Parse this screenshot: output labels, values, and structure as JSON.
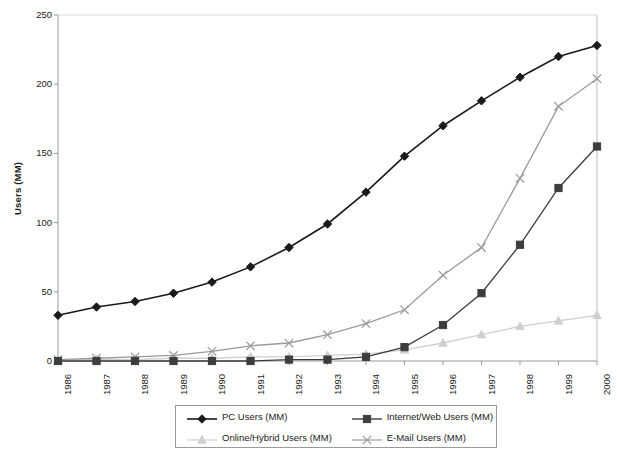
{
  "chart_data": {
    "type": "line",
    "title": "",
    "xlabel": "",
    "ylabel": "Users (MM)",
    "ylim": [
      0,
      250
    ],
    "yticks": [
      0,
      50,
      100,
      150,
      200,
      250
    ],
    "grid": false,
    "legend_position": "bottom",
    "categories": [
      "1986",
      "1987",
      "1988",
      "1989",
      "1990",
      "1991",
      "1992",
      "1993",
      "1994",
      "1995",
      "1996",
      "1997",
      "1998",
      "1999",
      "2000"
    ],
    "series": [
      {
        "name": "PC Users (MM)",
        "marker": "diamond",
        "color": "#1a1a1a",
        "values": [
          33,
          39,
          43,
          49,
          57,
          68,
          82,
          99,
          122,
          148,
          170,
          188,
          205,
          220,
          228
        ]
      },
      {
        "name": "Internet/Web Users (MM)",
        "marker": "square",
        "color": "#3d3d3d",
        "values": [
          0,
          0,
          0,
          0,
          0,
          0,
          1,
          1,
          3,
          10,
          26,
          49,
          84,
          125,
          155
        ]
      },
      {
        "name": "Online/Hybrid Users (MM)",
        "marker": "triangle",
        "color": "#cfcfcf",
        "values": [
          1,
          1,
          1,
          2,
          2,
          3,
          3,
          4,
          5,
          8,
          13,
          19,
          25,
          29,
          33
        ]
      },
      {
        "name": "E-Mail Users (MM)",
        "marker": "cross",
        "color": "#9a9a9a",
        "values": [
          1,
          2,
          3,
          4,
          7,
          11,
          13,
          19,
          27,
          37,
          62,
          82,
          132,
          184,
          204
        ]
      }
    ]
  },
  "axes": {
    "y_title": "Users (MM)",
    "y_tick_labels": [
      "250",
      "200",
      "150",
      "100",
      "50",
      "0"
    ],
    "x_tick_labels": [
      "1986",
      "1987",
      "1988",
      "1989",
      "1990",
      "1991",
      "1992",
      "1993",
      "1994",
      "1995",
      "1996",
      "1997",
      "1998",
      "1999",
      "2000"
    ]
  },
  "legend": {
    "items": [
      {
        "label": "PC Users (MM)",
        "marker": "diamond-marker-icon",
        "color": "#1a1a1a"
      },
      {
        "label": "Internet/Web Users (MM)",
        "marker": "square-marker-icon",
        "color": "#3d3d3d"
      },
      {
        "label": "Online/Hybrid Users (MM)",
        "marker": "triangle-marker-icon",
        "color": "#cfcfcf"
      },
      {
        "label": "E-Mail Users (MM)",
        "marker": "cross-marker-icon",
        "color": "#9a9a9a"
      }
    ]
  }
}
